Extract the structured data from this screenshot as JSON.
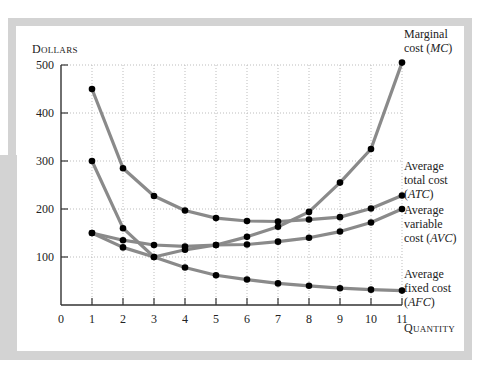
{
  "chart_data": {
    "type": "line",
    "title": "",
    "xlabel": "Quantity",
    "ylabel": "Dollars",
    "x": [
      1,
      2,
      3,
      4,
      5,
      6,
      7,
      8,
      9,
      10,
      11
    ],
    "xlim": [
      0,
      11
    ],
    "ylim": [
      0,
      500
    ],
    "x_ticks": [
      "0",
      "1",
      "2",
      "3",
      "4",
      "5",
      "6",
      "7",
      "8",
      "9",
      "10",
      "11"
    ],
    "y_ticks": [
      "100",
      "200",
      "300",
      "400",
      "500"
    ],
    "grid": true,
    "legend_position": "inline-right",
    "series": [
      {
        "name": "Marginal cost (MC)",
        "label_lines": [
          "Marginal",
          "cost (MC)"
        ],
        "values": [
          150,
          120,
          100,
          115,
          125,
          142,
          163,
          194,
          255,
          325,
          505
        ]
      },
      {
        "name": "Average total cost (ATC)",
        "label_lines": [
          "Average",
          "total cost",
          "(ATC)"
        ],
        "values": [
          450,
          285,
          227,
          197,
          181,
          175,
          174,
          178,
          183,
          201,
          228
        ]
      },
      {
        "name": "Average variable cost (AVC)",
        "label_lines": [
          "Average",
          "variable",
          "cost (AVC)"
        ],
        "values": [
          150,
          135,
          125,
          122,
          125,
          126,
          132,
          140,
          153,
          172,
          200
        ]
      },
      {
        "name": "Average fixed cost (AFC)",
        "label_lines": [
          "Average",
          "fixed cost",
          "(AFC)"
        ],
        "values": [
          300,
          160,
          100,
          78,
          62,
          53,
          45,
          40,
          35,
          32,
          30
        ]
      }
    ]
  },
  "axis": {
    "y_title": "Dollars",
    "x_title": "Quantity",
    "origin_label": "0"
  },
  "colors": {
    "curve": "#8a8a8a",
    "marker": "#000000",
    "frame": "#d3d3d3",
    "grid": "#bdbdbd",
    "axis": "#333333"
  }
}
